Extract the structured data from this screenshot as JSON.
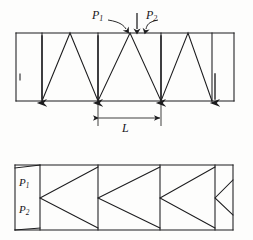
{
  "figure": {
    "type": "engineering-diagram",
    "background_color": "#fdfdfc",
    "line_color": "#1c1c1e",
    "canvas": {
      "width": 253,
      "height": 240
    }
  },
  "top_diagram": {
    "name": "w-truss-elevation",
    "frame": {
      "x0": 16,
      "y0": 33,
      "x1": 234,
      "y1": 101
    },
    "verticals_x": [
      16,
      42,
      98,
      161,
      212,
      234
    ],
    "bottom_load_nodes_x": [
      42,
      98,
      161,
      215
    ],
    "labels": {
      "p1": {
        "text": "P",
        "sub": "1"
      },
      "p2": {
        "text": "P",
        "sub": "2"
      }
    },
    "load_arrows": [
      {
        "name": "p1-curved-arrow",
        "target_x": 125,
        "kind": "curved"
      },
      {
        "name": "center-straight-arrow",
        "target_x": 137,
        "kind": "straight"
      },
      {
        "name": "p2-curved-arrow",
        "target_x": 150,
        "kind": "curved"
      }
    ]
  },
  "dimension": {
    "name": "panel-length-dimension",
    "label": "L",
    "from_x": 98,
    "to_x": 161,
    "y": 118
  },
  "bottom_diagram": {
    "name": "panel-bracing-elevation",
    "frame": {
      "x0": 15,
      "y0": 165,
      "x1": 233,
      "y1": 230
    },
    "verticals_x": [
      15,
      40,
      98,
      160,
      215,
      233
    ],
    "labels": {
      "p1": {
        "text": "P",
        "sub": "1"
      },
      "p2": {
        "text": "P",
        "sub": "2"
      }
    }
  },
  "colors": {
    "ink": "#1c1c1e",
    "paper": "#fdfdfc",
    "light_rule": "#cfcfcf"
  }
}
